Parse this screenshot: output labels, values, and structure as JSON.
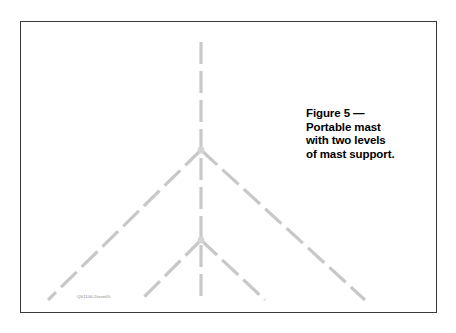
{
  "figure": {
    "frame": {
      "border_color": "#3a3a3a",
      "background": "#ffffff"
    },
    "caption": {
      "line1": "Figure 5 —",
      "line2": "Portable mast",
      "line3": "with two levels",
      "line4": "of mast support.",
      "color": "#000000"
    },
    "credit": {
      "text": "QS1106-Dixon05",
      "color": "#8a8a8a"
    },
    "diagram": {
      "line_color": "#c8c8c8",
      "mast": {
        "label": "vertical portable mast",
        "x": 201,
        "y_top": 42,
        "y_bottom": 300
      },
      "upper_support": {
        "label": "upper level of mast support",
        "junction_x": 201,
        "junction_y": 150,
        "left_end_x": 48,
        "left_end_y": 300,
        "right_end_x": 365,
        "right_end_y": 300
      },
      "lower_support": {
        "label": "lower level of mast support",
        "junction_x": 201,
        "junction_y": 240,
        "left_end_x": 141,
        "left_end_y": 300,
        "right_end_x": 265,
        "right_end_y": 300
      }
    }
  }
}
